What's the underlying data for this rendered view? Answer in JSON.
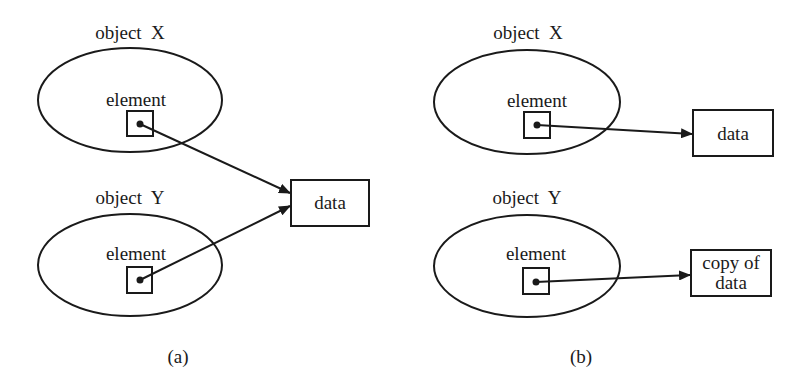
{
  "panels": {
    "a": {
      "caption": "(a)",
      "object_x": {
        "label": "object  X",
        "element_label": "element"
      },
      "object_y": {
        "label": "object  Y",
        "element_label": "element"
      },
      "data_box": {
        "label": "data"
      }
    },
    "b": {
      "caption": "(b)",
      "object_x": {
        "label": "object  X",
        "element_label": "element"
      },
      "object_y": {
        "label": "object  Y",
        "element_label": "element"
      },
      "data_box": {
        "label": "data"
      },
      "copy_box": {
        "line1": "copy of",
        "line2": "data"
      }
    }
  },
  "colors": {
    "stroke": "#1a1a1a",
    "background": "#ffffff"
  }
}
